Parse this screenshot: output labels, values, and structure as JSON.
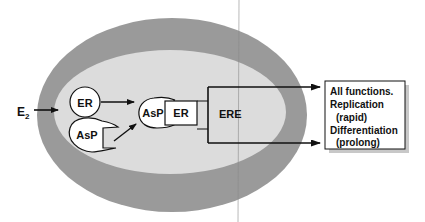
{
  "colors": {
    "outer_membrane": "#9a9a9a",
    "inner_cytoplasm": "#dcdcdc",
    "stroke": "#111111",
    "box_fill": "#ffffff",
    "shadow": "#c8c8c8",
    "scan_line": "#8a8a8a"
  },
  "input": {
    "label": "E",
    "subscript": "2"
  },
  "receptor": {
    "label": "ER"
  },
  "adapter": {
    "label": "AsP"
  },
  "complex": {
    "adapter_label": "AsP",
    "receptor_label": "ER"
  },
  "element": {
    "label": "ERE"
  },
  "outcomes": {
    "lines": [
      "All functions.",
      "Replication",
      "  (rapid)",
      "Differentiation",
      "  (prolong)"
    ]
  }
}
